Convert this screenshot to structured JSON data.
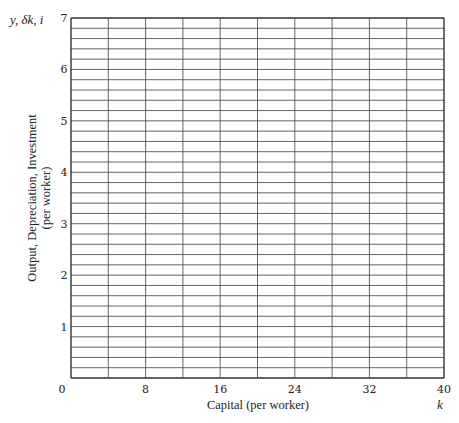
{
  "chart_data": {
    "type": "line",
    "title": "",
    "xlabel": "Capital (per worker)",
    "ylabel": "Output, Depreciation, Investment",
    "ylabel_sub": "(per worker)",
    "x_variable": "k",
    "y_variables": "y, δk, i",
    "xlim": [
      0,
      40
    ],
    "ylim": [
      0,
      7
    ],
    "x_ticks": [
      0,
      8,
      16,
      24,
      32,
      40
    ],
    "y_ticks": [
      1,
      2,
      3,
      4,
      5,
      6,
      7
    ],
    "x_grid_step": 4,
    "y_grid_step": 0.2,
    "grid": true,
    "series": [],
    "legend": null
  },
  "labels": {
    "xlabel": "Capital (per worker)",
    "ylabel_line1": "Output, Depreciation, Investment",
    "ylabel_line2": "(per worker)",
    "x_var": "k",
    "y_vars": "y, δk, i"
  },
  "colors": {
    "grid": "#555555",
    "axis": "#333333",
    "background": "#ffffff"
  }
}
